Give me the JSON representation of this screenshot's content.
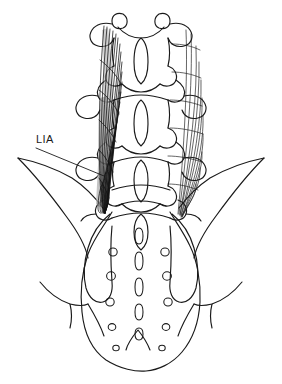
{
  "figure": {
    "type": "anatomical-line-drawing",
    "view": "posterior",
    "background_color": "#ffffff",
    "line_color": "#1a1a1a",
    "shading_color": "#9a9a9a"
  },
  "labels": [
    {
      "id": "lia",
      "text": "LIA",
      "x": 36,
      "y": 143,
      "leader_from_x": 36,
      "leader_from_y": 148,
      "leader_to_x": 104,
      "leader_to_y": 176
    }
  ],
  "structures": {
    "vertebrae_label": "lumbar vertebrae",
    "vertebrae_count": 5,
    "sacrum_label": "sacrum",
    "sacral_foramina_pairs": 5,
    "median_crest_segments": 5,
    "sacral_hiatus_label": "sacral hiatus",
    "ilium_left_label": "left ilium",
    "ilium_right_label": "right ilium",
    "ligament_left_label": "iliolumbar ligament (shaded)",
    "ligament_right_label": "iliolumbar ligament (outline)"
  },
  "chart_data": {
    "type": "diagram",
    "title": "",
    "annotations": [
      "LIA"
    ]
  }
}
